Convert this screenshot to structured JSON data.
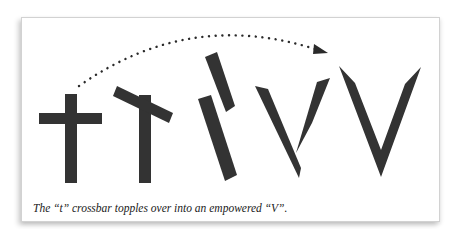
{
  "figure": {
    "caption": "The “t” crossbar topples over into an empowered “V”.",
    "colors": {
      "glyph": "#333333",
      "arc": "#2a2a2a",
      "card_border": "#d2d2d2",
      "background": "#ffffff"
    },
    "stages": [
      {
        "name": "upright-t",
        "description": "cross with horizontal crossbar"
      },
      {
        "name": "tilting-t",
        "description": "crossbar tilting"
      },
      {
        "name": "toppled-bars",
        "description": "two slanted bars"
      },
      {
        "name": "forming-v",
        "description": "bars forming a V"
      },
      {
        "name": "empowered-v",
        "description": "final V shape"
      }
    ],
    "arrow": {
      "style": "dotted arc",
      "direction": "left-to-right"
    }
  }
}
